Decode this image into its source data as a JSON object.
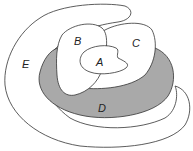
{
  "diagram": {
    "type": "euler-diagram",
    "regions": [
      {
        "id": "E",
        "label": "E",
        "fill": "#ffffff",
        "shaded": false
      },
      {
        "id": "D",
        "label": "D",
        "fill": "#a9a9a9",
        "shaded": true
      },
      {
        "id": "C",
        "label": "C",
        "fill": "#ffffff",
        "shaded": false
      },
      {
        "id": "B",
        "label": "B",
        "fill": "#ffffff",
        "shaded": false
      },
      {
        "id": "A",
        "label": "A",
        "fill": "#ffffff",
        "shaded": false
      }
    ],
    "stroke_color": "#333333"
  }
}
